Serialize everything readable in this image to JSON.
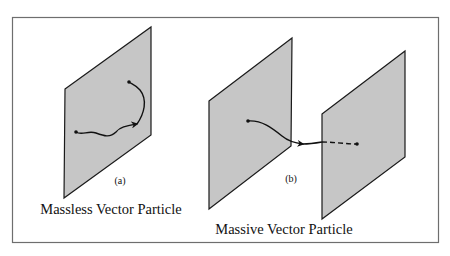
{
  "figure": {
    "colors": {
      "border": "#6e6e6e",
      "plane_fill": "#c6c6c6",
      "plane_stroke": "#1a1a1a",
      "path": "#111111",
      "background": "#ffffff"
    },
    "panel_a": {
      "label": "(a)",
      "caption": "Massless Vector Particle"
    },
    "panel_b": {
      "label": "(b)",
      "caption": "Massive Vector Particle"
    }
  }
}
